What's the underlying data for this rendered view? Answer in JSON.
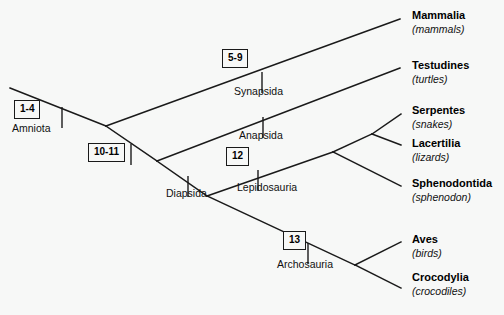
{
  "figure": {
    "background_color": "#f7f8f7",
    "line_color": "#1a1a1a",
    "text_color": "#000000"
  },
  "terminal_taxa": [
    {
      "name": "Mammalia",
      "common_name": "(mammals)",
      "x": 412,
      "y": 10
    },
    {
      "name": "Testudines",
      "common_name": "(turtles)",
      "x": 412,
      "y": 60
    },
    {
      "name": "Serpentes",
      "common_name": "(snakes)",
      "x": 412,
      "y": 105
    },
    {
      "name": "Lacertilia",
      "common_name": "(lizards)",
      "x": 412,
      "y": 138
    },
    {
      "name": "Sphenodontida",
      "common_name": "(sphenodon)",
      "x": 412,
      "y": 178
    },
    {
      "name": "Aves",
      "common_name": "(birds)",
      "x": 412,
      "y": 234
    },
    {
      "name": "Crocodylia",
      "common_name": "(crocodiles)",
      "x": 412,
      "y": 272
    }
  ],
  "clade_labels": [
    {
      "text": "Amniota",
      "x": 12,
      "y": 123
    },
    {
      "text": "Synapsida",
      "x": 234,
      "y": 86
    },
    {
      "text": "Anapsida",
      "x": 239,
      "y": 130
    },
    {
      "text": "Diapsida",
      "x": 166,
      "y": 188
    },
    {
      "text": "Lepidosauria",
      "x": 237,
      "y": 182
    },
    {
      "text": "Archosauria",
      "x": 277,
      "y": 259
    }
  ],
  "character_boxes": [
    {
      "label": "1-4",
      "x": 14,
      "y": 100
    },
    {
      "label": "5-9",
      "x": 222,
      "y": 49
    },
    {
      "label": "10-11",
      "x": 88,
      "y": 143
    },
    {
      "label": "12",
      "x": 226,
      "y": 147
    },
    {
      "label": "13",
      "x": 283,
      "y": 231
    }
  ],
  "branches": [
    {
      "name": "root-to-amniota-node",
      "x1": 10,
      "y1": 88,
      "x2": 106,
      "y2": 126
    },
    {
      "name": "amniota-to-synapsida",
      "x1": 106,
      "y1": 126,
      "x2": 400,
      "y2": 19
    },
    {
      "name": "amniota-to-reptilia",
      "x1": 106,
      "y1": 126,
      "x2": 157,
      "y2": 161
    },
    {
      "name": "reptilia-to-anapsida",
      "x1": 157,
      "y1": 161,
      "x2": 400,
      "y2": 68
    },
    {
      "name": "reptilia-to-diapsida",
      "x1": 157,
      "y1": 161,
      "x2": 207,
      "y2": 196
    },
    {
      "name": "diapsida-to-lepidosauria",
      "x1": 207,
      "y1": 196,
      "x2": 333,
      "y2": 152
    },
    {
      "name": "diapsida-to-archosauria",
      "x1": 207,
      "y1": 196,
      "x2": 355,
      "y2": 265
    },
    {
      "name": "lepidosauria-to-squamata",
      "x1": 333,
      "y1": 152,
      "x2": 372,
      "y2": 134
    },
    {
      "name": "squamata-to-serpentes",
      "x1": 372,
      "y1": 134,
      "x2": 401,
      "y2": 114
    },
    {
      "name": "squamata-to-lacertilia",
      "x1": 372,
      "y1": 134,
      "x2": 401,
      "y2": 145
    },
    {
      "name": "lepidosauria-to-sphenodontida",
      "x1": 333,
      "y1": 152,
      "x2": 401,
      "y2": 186
    },
    {
      "name": "archosauria-to-aves",
      "x1": 355,
      "y1": 265,
      "x2": 401,
      "y2": 242
    },
    {
      "name": "archosauria-to-crocodylia",
      "x1": 355,
      "y1": 265,
      "x2": 401,
      "y2": 288
    }
  ],
  "tick_marks": [
    {
      "name": "tick-amniota",
      "x": 62,
      "y": 107,
      "height": 21
    },
    {
      "name": "tick-synapsida",
      "x": 262,
      "y": 72,
      "height": 21
    },
    {
      "name": "tick-reptilia",
      "x": 131,
      "y": 144,
      "height": 21
    },
    {
      "name": "tick-anapsida",
      "x": 263,
      "y": 117,
      "height": 21
    },
    {
      "name": "tick-diapsida",
      "x": 188,
      "y": 176,
      "height": 21
    },
    {
      "name": "tick-lepidosauria",
      "x": 258,
      "y": 170,
      "height": 21
    },
    {
      "name": "tick-archosauria",
      "x": 308,
      "y": 243,
      "height": 21
    }
  ]
}
